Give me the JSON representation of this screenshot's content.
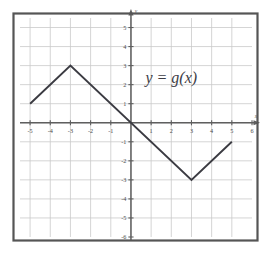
{
  "figure": {
    "title": "",
    "curve_label": "y = g(x)",
    "axis_x_name": "x",
    "axis_y_name": "y",
    "border_color": "#555555",
    "grid_color": "#c9c9c9",
    "axis_color": "#5f5f5f",
    "curve_color": "#3b3b42",
    "label_color": "#3d3d46"
  },
  "chart_data": {
    "type": "line",
    "title": "",
    "xlabel": "x",
    "ylabel": "y",
    "xlim": [
      -5.5,
      6
    ],
    "ylim": [
      -6,
      5.5
    ],
    "grid": true,
    "grid_step": 1,
    "legend": "none",
    "annotations": [
      {
        "text": "y = g(x)",
        "x": 2.0,
        "y": 2.1
      }
    ],
    "xticks": [
      -5,
      -4,
      -3,
      -2,
      -1,
      1,
      2,
      3,
      4,
      5,
      6
    ],
    "xtick_labels": [
      "-5",
      "-4",
      "-3",
      "-2",
      "-1",
      "1",
      "2",
      "3",
      "4",
      "5",
      "6"
    ],
    "yticks": [
      5,
      4,
      3,
      2,
      1,
      -1,
      -2,
      -3,
      -4,
      -5,
      -6
    ],
    "ytick_labels": [
      "5",
      "4",
      "3",
      "2",
      "1",
      "-1",
      "-2",
      "-3",
      "-4",
      "-5",
      "-6"
    ],
    "series": [
      {
        "name": "g",
        "x": [
          -5,
          -3,
          3,
          5
        ],
        "values": [
          1,
          3,
          -3,
          -1
        ]
      }
    ]
  }
}
